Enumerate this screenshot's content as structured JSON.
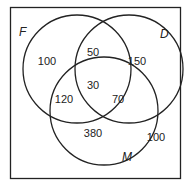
{
  "diagram": {
    "type": "venn",
    "sets": [
      {
        "name": "F",
        "label": "F"
      },
      {
        "name": "D",
        "label": "D"
      },
      {
        "name": "M",
        "label": "M"
      }
    ],
    "regions": {
      "F_only": "100",
      "D_only": "150",
      "M_only": "380",
      "F_and_D_only": "50",
      "F_and_M_only": "120",
      "D_and_M_only": "70",
      "F_and_D_and_M": "30",
      "outside": "100"
    },
    "colors": {
      "stroke": "#222222",
      "background": "#ffffff"
    }
  }
}
